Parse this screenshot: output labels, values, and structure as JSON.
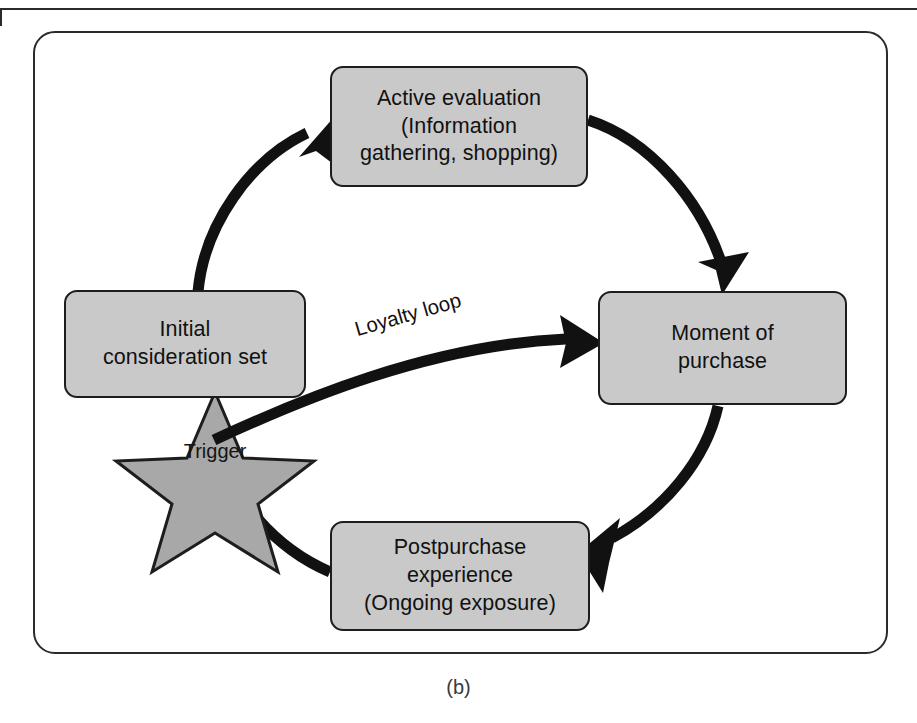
{
  "figure": {
    "caption": "(b)",
    "colors": {
      "node_fill": "#c9c9c9",
      "node_stroke": "#1d1d1d",
      "star_fill": "#a8a8a8",
      "star_stroke": "#1d1d1d",
      "arrow": "#111111",
      "frame": "#2b2b2b",
      "background": "#ffffff",
      "text": "#111111"
    }
  },
  "nodes": {
    "active_evaluation": {
      "label": "Active evaluation\n(Information\ngathering, shopping)"
    },
    "initial_consideration": {
      "label": "Initial\nconsideration set"
    },
    "moment_of_purchase": {
      "label": "Moment of\npurchase"
    },
    "postpurchase": {
      "label": "Postpurchase experience\n(Ongoing exposure)"
    }
  },
  "star": {
    "label": "Trigger"
  },
  "edges": {
    "loyalty_loop": {
      "label": "Loyalty loop"
    },
    "consideration_to_evaluation": {
      "label": ""
    },
    "evaluation_to_purchase": {
      "label": ""
    },
    "purchase_to_postpurchase": {
      "label": ""
    },
    "postpurchase_to_purchase": {
      "label": ""
    }
  }
}
